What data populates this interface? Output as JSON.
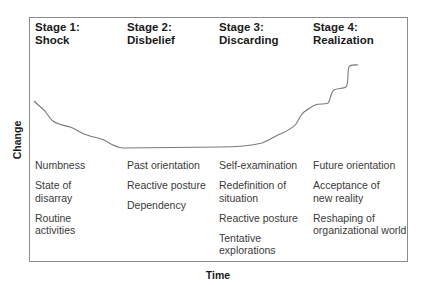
{
  "diagram": {
    "y_axis_label": "Change",
    "x_axis_label": "Time",
    "line_color": "#7a7a7a",
    "frame_color": "#8a8a8a",
    "stages": [
      {
        "title_line1": "Stage 1:",
        "title_line2": "Shock",
        "items": [
          "Numbness",
          "State of\ndisarray",
          "Routine\nactivities"
        ]
      },
      {
        "title_line1": "Stage 2:",
        "title_line2": "Disbelief",
        "items": [
          "Past orientation",
          "Reactive posture",
          "Dependency"
        ]
      },
      {
        "title_line1": "Stage 3:",
        "title_line2": "Discarding",
        "items": [
          "Self-examination",
          "Redefinition of\nsituation",
          "Reactive posture",
          "Tentative\nexplorations"
        ]
      },
      {
        "title_line1": "Stage 4:",
        "title_line2": "Realization",
        "items": [
          "Future orientation",
          "Acceptance of\nnew reality",
          "Reshaping of\norganizational world"
        ]
      }
    ],
    "curve_description": "Change declines through Shock, bottoms flat through Disbelief and early Discarding, then rises in steps through Realization"
  }
}
